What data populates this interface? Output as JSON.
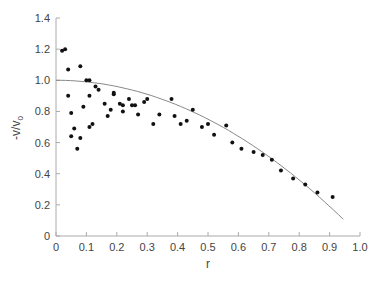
{
  "chart_data": {
    "type": "scatter",
    "title": "",
    "xlabel": "r",
    "ylabel": "-v/v0",
    "ylabel_main": "-v/v",
    "ylabel_sub": "0",
    "xlim": [
      0,
      1.0
    ],
    "ylim": [
      0,
      1.4
    ],
    "grid": false,
    "legend": "none",
    "x_ticks": [
      "0",
      "0.1",
      "0.2",
      "0.3",
      "0.4",
      "0.5",
      "0.6",
      "0.7",
      "0.8",
      "0.9",
      "1.0"
    ],
    "y_ticks": [
      "0",
      "0.2",
      "0.4",
      "0.6",
      "0.8",
      "1.0",
      "1.2",
      "1.4"
    ],
    "series": [
      {
        "name": "measured",
        "kind": "scatter",
        "points": [
          [
            0.02,
            1.19
          ],
          [
            0.03,
            1.2
          ],
          [
            0.04,
            1.07
          ],
          [
            0.04,
            0.9
          ],
          [
            0.05,
            0.79
          ],
          [
            0.05,
            0.64
          ],
          [
            0.06,
            0.69
          ],
          [
            0.07,
            0.56
          ],
          [
            0.08,
            0.63
          ],
          [
            0.08,
            1.09
          ],
          [
            0.09,
            0.83
          ],
          [
            0.1,
            1.0
          ],
          [
            0.11,
            1.0
          ],
          [
            0.11,
            0.9
          ],
          [
            0.11,
            0.7
          ],
          [
            0.12,
            0.72
          ],
          [
            0.13,
            0.96
          ],
          [
            0.14,
            0.94
          ],
          [
            0.16,
            0.85
          ],
          [
            0.17,
            0.77
          ],
          [
            0.19,
            0.91
          ],
          [
            0.19,
            0.92
          ],
          [
            0.18,
            0.81
          ],
          [
            0.21,
            0.85
          ],
          [
            0.22,
            0.84
          ],
          [
            0.22,
            0.8
          ],
          [
            0.24,
            0.88
          ],
          [
            0.25,
            0.84
          ],
          [
            0.26,
            0.84
          ],
          [
            0.27,
            0.78
          ],
          [
            0.29,
            0.86
          ],
          [
            0.3,
            0.88
          ],
          [
            0.32,
            0.72
          ],
          [
            0.34,
            0.78
          ],
          [
            0.38,
            0.88
          ],
          [
            0.39,
            0.77
          ],
          [
            0.41,
            0.72
          ],
          [
            0.43,
            0.74
          ],
          [
            0.45,
            0.81
          ],
          [
            0.48,
            0.7
          ],
          [
            0.5,
            0.72
          ],
          [
            0.52,
            0.65
          ],
          [
            0.56,
            0.71
          ],
          [
            0.58,
            0.6
          ],
          [
            0.61,
            0.56
          ],
          [
            0.65,
            0.54
          ],
          [
            0.68,
            0.52
          ],
          [
            0.71,
            0.49
          ],
          [
            0.74,
            0.42
          ],
          [
            0.78,
            0.37
          ],
          [
            0.82,
            0.33
          ],
          [
            0.86,
            0.28
          ],
          [
            0.91,
            0.25
          ]
        ]
      },
      {
        "name": "fit",
        "kind": "line",
        "equation": "1 - r^2",
        "x": [
          0,
          0.1,
          0.2,
          0.3,
          0.4,
          0.5,
          0.6,
          0.7,
          0.8,
          0.9,
          0.95
        ],
        "values": [
          1.0,
          0.99,
          0.96,
          0.91,
          0.84,
          0.75,
          0.64,
          0.51,
          0.36,
          0.19,
          0.1
        ]
      }
    ]
  }
}
